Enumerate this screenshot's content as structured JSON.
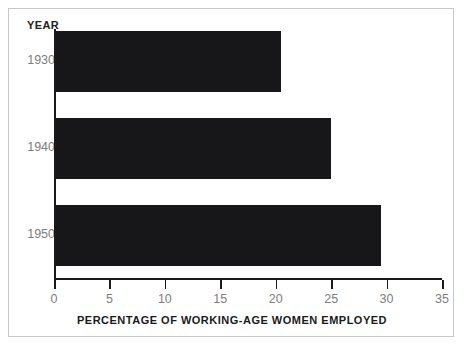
{
  "chart_data": {
    "type": "bar",
    "orientation": "horizontal",
    "title": "",
    "categories": [
      "1930",
      "1940",
      "1950"
    ],
    "values": [
      20.5,
      25.0,
      29.5
    ],
    "xlabel": "PERCENTAGE OF WORKING-AGE WOMEN EMPLOYED",
    "ylabel": "YEAR",
    "xlim": [
      0,
      35
    ],
    "xticks": [
      "0",
      "5",
      "10",
      "15",
      "20",
      "25",
      "30",
      "35"
    ],
    "xtick_values": [
      0,
      5,
      10,
      15,
      20,
      25,
      30,
      35
    ],
    "grid": false,
    "legend": false,
    "bar_color": "#17171a",
    "tick_label_color": "#7d7d7d",
    "axis_color": "#1a1a1a",
    "frame_color": "#c8c8c8",
    "background": "#ffffff"
  }
}
